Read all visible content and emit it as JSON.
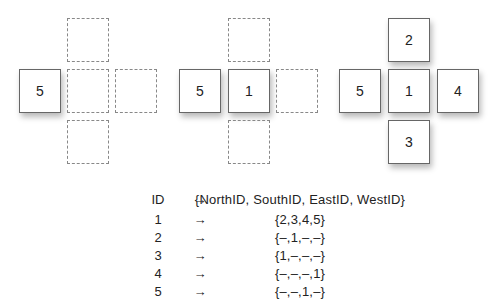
{
  "panels": [
    {
      "placed": [
        {
          "id": "5",
          "position": "west"
        }
      ],
      "empty_slots": [
        "north",
        "center",
        "east",
        "south"
      ]
    },
    {
      "placed": [
        {
          "id": "5",
          "position": "west"
        },
        {
          "id": "1",
          "position": "center"
        }
      ],
      "empty_slots": [
        "north",
        "east",
        "south"
      ]
    },
    {
      "placed": [
        {
          "id": "2",
          "position": "north"
        },
        {
          "id": "5",
          "position": "west"
        },
        {
          "id": "1",
          "position": "center"
        },
        {
          "id": "4",
          "position": "east"
        },
        {
          "id": "3",
          "position": "south"
        }
      ],
      "empty_slots": []
    }
  ],
  "table": {
    "header": {
      "id": "ID",
      "arrow": "→",
      "value": "{NorthID, SouthID, EastID, WestID}"
    },
    "rows": [
      {
        "id": "1",
        "arrow": "→",
        "value": "{2,3,4,5}"
      },
      {
        "id": "2",
        "arrow": "→",
        "value": "{–,1,–,–}"
      },
      {
        "id": "3",
        "arrow": "→",
        "value": "{1,–,–,–}"
      },
      {
        "id": "4",
        "arrow": "→",
        "value": "{–,–,–,1}"
      },
      {
        "id": "5",
        "arrow": "→",
        "value": "{–,–,1,–}"
      }
    ]
  }
}
